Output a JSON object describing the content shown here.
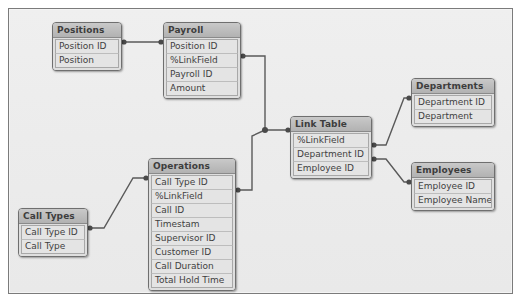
{
  "diagram": {
    "type": "database-relationship-diagram",
    "background_color": "#ececec",
    "frame_border_color": "#7b7b7b",
    "table_header_color": "#bdbdbd",
    "table_field_color": "#e4e4e4",
    "connector_color": "#5a5a5a",
    "tables": [
      {
        "id": "positions",
        "name": "Positions",
        "x": 52,
        "y": 22,
        "width": 70,
        "fields": [
          "Position ID",
          "Position"
        ]
      },
      {
        "id": "payroll",
        "name": "Payroll",
        "x": 163,
        "y": 22,
        "width": 78,
        "fields": [
          "Position ID",
          "%LinkField",
          "Payroll ID",
          "Amount"
        ]
      },
      {
        "id": "link_table",
        "name": "Link Table",
        "x": 290,
        "y": 116,
        "width": 82,
        "fields": [
          "%LinkField",
          "Department ID",
          "Employee ID"
        ]
      },
      {
        "id": "departments",
        "name": "Departments",
        "x": 411,
        "y": 78,
        "width": 84,
        "fields": [
          "Department ID",
          "Department"
        ]
      },
      {
        "id": "employees",
        "name": "Employees",
        "x": 411,
        "y": 162,
        "width": 84,
        "fields": [
          "Employee ID",
          "Employee Name"
        ]
      },
      {
        "id": "operations",
        "name": "Operations",
        "x": 148,
        "y": 158,
        "width": 88,
        "fields": [
          "Call Type ID",
          "%LinkField",
          "Call ID",
          "Timestam",
          "Supervisor ID",
          "Customer ID",
          "Call Duration",
          "Total Hold Time"
        ]
      },
      {
        "id": "call_types",
        "name": "Call Types",
        "x": 18,
        "y": 208,
        "width": 70,
        "fields": [
          "Call Type ID",
          "Call Type"
        ]
      }
    ],
    "relationships": [
      {
        "id": "rel-positions-payroll",
        "from": "Positions.Position ID",
        "to": "Payroll.Position ID"
      },
      {
        "id": "rel-payroll-linktable",
        "from": "Payroll.%LinkField",
        "to": "Link Table.%LinkField"
      },
      {
        "id": "rel-operations-linktable",
        "from": "Operations.%LinkField",
        "to": "Link Table.%LinkField"
      },
      {
        "id": "rel-linktable-departments",
        "from": "Link Table.Department ID",
        "to": "Departments.Department ID"
      },
      {
        "id": "rel-linktable-employees",
        "from": "Link Table.Employee ID",
        "to": "Employees.Employee ID"
      },
      {
        "id": "rel-calltypes-operations",
        "from": "Call Types.Call Type ID",
        "to": "Operations.Call Type ID"
      }
    ]
  }
}
